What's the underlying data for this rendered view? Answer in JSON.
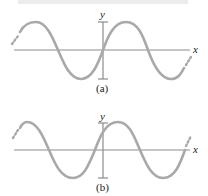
{
  "panels": [
    {
      "id": "a",
      "caption": "(a)",
      "x_label": "x",
      "y_label": "y",
      "description": "Sine wave passing through the origin, increasing"
    },
    {
      "id": "b",
      "caption": "(b)",
      "x_label": "x",
      "y_label": "y",
      "description": "Sine wave shifted left (phase-shifted), positive at origin"
    }
  ],
  "colors": {
    "curve": "#a9a9a9",
    "axis": "#8c8c8c",
    "text": "#222222"
  }
}
